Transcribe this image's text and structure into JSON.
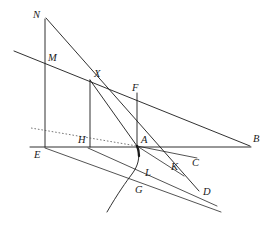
{
  "figure": {
    "background_color": "#ffffff",
    "stroke_color": "#1a1a1a",
    "dotted_stroke_color": "#555555",
    "width": 276,
    "height": 232
  },
  "labels": {
    "N": "N",
    "M": "M",
    "X": "X",
    "F": "F",
    "H": "H",
    "A": "A",
    "B": "B",
    "E": "E",
    "K": "K",
    "C": "C",
    "L": "L",
    "G": "G",
    "D": "D"
  },
  "points": {
    "N": {
      "x": 45,
      "y": 19,
      "label_x": 33,
      "label_y": 18
    },
    "M": {
      "x": 45,
      "y": 62,
      "label_x": 48,
      "label_y": 61
    },
    "X": {
      "x": 90,
      "y": 80,
      "label_x": 94,
      "label_y": 77
    },
    "F": {
      "x": 137,
      "y": 93,
      "label_x": 132,
      "label_y": 91
    },
    "H": {
      "x": 90,
      "y": 146,
      "label_x": 79,
      "label_y": 143
    },
    "A": {
      "x": 137,
      "y": 146,
      "label_x": 141,
      "label_y": 143
    },
    "B": {
      "x": 250,
      "y": 146,
      "label_x": 253,
      "label_y": 141
    },
    "E": {
      "x": 45,
      "y": 146,
      "label_x": 35,
      "label_y": 157
    },
    "K": {
      "x": 173,
      "y": 161,
      "label_x": 172,
      "label_y": 169
    },
    "C": {
      "x": 196,
      "y": 158,
      "label_x": 192,
      "label_y": 165
    },
    "L": {
      "x": 134,
      "y": 170,
      "label_x": 146,
      "label_y": 175
    },
    "G": {
      "x": 126,
      "y": 186,
      "label_x": 136,
      "label_y": 192
    },
    "D": {
      "x": 199,
      "y": 190,
      "label_x": 203,
      "label_y": 194
    }
  },
  "segments": [
    {
      "name": "vertical-N-E",
      "from": "N",
      "to": "E"
    },
    {
      "name": "line-N-to-D",
      "from": "N",
      "to": "D"
    },
    {
      "name": "line-M-to-B",
      "from": "M-left-extension",
      "to": "B"
    },
    {
      "name": "vertical-X-H",
      "from": "X",
      "to": "H"
    },
    {
      "name": "vertical-F-A",
      "from": "F",
      "to": "A"
    },
    {
      "name": "line-X-to-A",
      "from": "X",
      "to": "A"
    },
    {
      "name": "baseline-E-B",
      "from": "E",
      "to": "B"
    },
    {
      "name": "line-E-to-D",
      "from": "E",
      "to": "D"
    },
    {
      "name": "line-H-to-D",
      "from": "H",
      "to": "D"
    },
    {
      "name": "line-A-to-C",
      "from": "A",
      "to": "C"
    },
    {
      "name": "line-A-to-K",
      "from": "A",
      "to": "K"
    },
    {
      "name": "dotted-line-to-A",
      "from": "left-edge",
      "to": "A"
    }
  ],
  "curve": {
    "name": "curve-A-L-G",
    "through": [
      "A",
      "L",
      "G"
    ],
    "description": "concave arc from A curving down-left through L and G"
  }
}
